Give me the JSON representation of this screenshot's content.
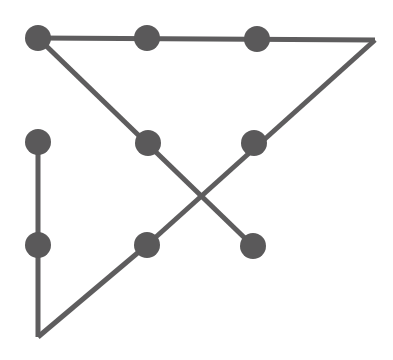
{
  "figure": {
    "type": "node-link-diagram",
    "width": 393,
    "height": 360,
    "background_color": "#ffffff",
    "stroke_color": "#5e5d5e",
    "node_color": "#5a595a",
    "stroke_width": 5,
    "node_radius": 13
  },
  "nodes": [
    {
      "id": "n1",
      "name": "node-top-left",
      "x": 38,
      "y": 38,
      "r": 13
    },
    {
      "id": "n2",
      "name": "node-top-middle",
      "x": 147,
      "y": 38,
      "r": 13
    },
    {
      "id": "n3",
      "name": "node-top-right",
      "x": 257,
      "y": 39,
      "r": 13
    },
    {
      "id": "n4",
      "name": "node-left-upper",
      "x": 38,
      "y": 142,
      "r": 13
    },
    {
      "id": "n5",
      "name": "node-center-upper",
      "x": 148,
      "y": 143,
      "r": 13
    },
    {
      "id": "n6",
      "name": "node-right-upper",
      "x": 254,
      "y": 143,
      "r": 13
    },
    {
      "id": "n7",
      "name": "node-left-lower",
      "x": 38,
      "y": 245,
      "r": 13
    },
    {
      "id": "n8",
      "name": "node-center-lower",
      "x": 147,
      "y": 245,
      "r": 13
    },
    {
      "id": "n9",
      "name": "node-right-lower",
      "x": 253,
      "y": 246,
      "r": 13
    }
  ],
  "vertices": [
    {
      "id": "v1",
      "name": "corner-right-apex",
      "x": 375,
      "y": 40
    },
    {
      "id": "v2",
      "name": "corner-bottom-left",
      "x": 38,
      "y": 337
    }
  ],
  "edges": [
    {
      "id": "e1",
      "name": "edge-top-horizontal",
      "from": "n1",
      "to": "v1",
      "x1": 38,
      "y1": 38,
      "x2": 375,
      "y2": 40
    },
    {
      "id": "e2",
      "name": "edge-right-diagonal",
      "from": "v1",
      "to": "n8",
      "x1": 375,
      "y1": 40,
      "x2": 147,
      "y2": 245
    },
    {
      "id": "e3",
      "name": "edge-left-diagonal",
      "from": "n1",
      "to": "n9",
      "x1": 38,
      "y1": 38,
      "x2": 253,
      "y2": 246
    },
    {
      "id": "e4",
      "name": "edge-left-vertical",
      "from": "n4",
      "to": "v2",
      "x1": 38,
      "y1": 142,
      "x2": 38,
      "y2": 337
    },
    {
      "id": "e5",
      "name": "edge-bottom-diagonal",
      "from": "v2",
      "to": "n8",
      "x1": 38,
      "y1": 337,
      "x2": 147,
      "y2": 245
    }
  ],
  "crossing": {
    "name": "edge-crossing-point",
    "x": 200,
    "y": 194
  }
}
